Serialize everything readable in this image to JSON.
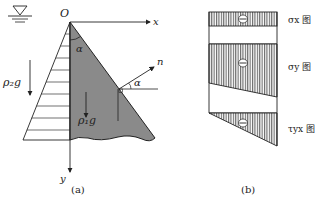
{
  "panel_a": {
    "caption": "(a)",
    "origin_label": "O",
    "x_axis_label": "x",
    "y_axis_label": "y",
    "normal_label": "n",
    "angle_label_top": "α",
    "angle_label_normal": "α",
    "water_density_label": "ρ₂g",
    "dam_density_label": "ρ₁g",
    "symbols": [
      "water-surface-icon"
    ],
    "colors": {
      "dam_fill": "#8a8a8a",
      "line": "#222222",
      "hatch": "#555555"
    }
  },
  "panel_b": {
    "caption": "(b)",
    "diagrams": [
      {
        "label": "σx 图",
        "sign": "minus"
      },
      {
        "label": "σy 图",
        "sign": "minus"
      },
      {
        "label": "τyx 图",
        "sign": "minus"
      }
    ]
  }
}
